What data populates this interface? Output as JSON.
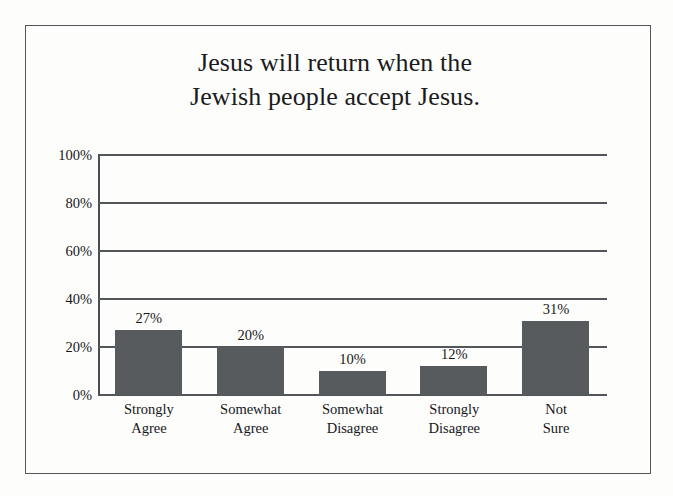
{
  "figure": {
    "background_color": "#fdfdfb",
    "frame_color": "#54575c",
    "bar_color": "#585b5e",
    "gridline_color": "#52555a",
    "text_color": "#17171a"
  },
  "chart_data": {
    "type": "bar",
    "title": "Jesus will return when the Jewish people accept Jesus.",
    "title_lines": [
      "Jesus will return when the",
      "Jewish people accept Jesus."
    ],
    "categories": [
      "Strongly Agree",
      "Somewhat Agree",
      "Somewhat Disagree",
      "Strongly Disagree",
      "Not Sure"
    ],
    "category_lines": [
      [
        "Strongly",
        "Agree"
      ],
      [
        "Somewhat",
        "Agree"
      ],
      [
        "Somewhat",
        "Disagree"
      ],
      [
        "Strongly",
        "Disagree"
      ],
      [
        "Not",
        "Sure"
      ]
    ],
    "values": [
      27,
      20,
      10,
      12,
      31
    ],
    "data_labels": [
      "27%",
      "20%",
      "10%",
      "12%",
      "31%"
    ],
    "xlabel": "",
    "ylabel": "",
    "ylim": [
      0,
      100
    ],
    "ytick_values": [
      0,
      20,
      40,
      60,
      80,
      100
    ],
    "ytick_labels": [
      "0%",
      "20%",
      "40%",
      "60%",
      "80%",
      "100%"
    ],
    "grid": true,
    "grid_axis": "y",
    "legend": false,
    "legend_position": "none"
  }
}
